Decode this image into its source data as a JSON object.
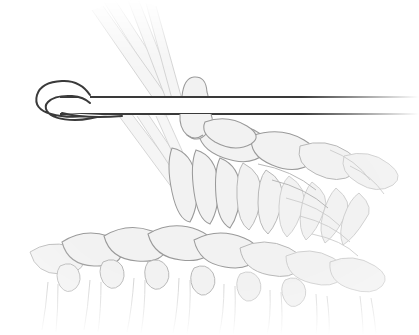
{
  "image": {
    "kind": "instructional-line-illustration",
    "subject": "crochet-stitch-diagram",
    "title": "Crochet hook drawing loop through fabric",
    "width_px": 419,
    "height_px": 335,
    "background_color": "#ffffff"
  },
  "palette": {
    "background": "#ffffff",
    "hook_outline": "#3a3a3a",
    "hook_fill": "#ffffff",
    "yarn_fill": "#f2f2f2",
    "yarn_outline": "#9a9a9a",
    "yarn_outline_soft": "#b4b4b4",
    "yarn_outline_faint": "#cccccc",
    "strand_fill": "#f4f4f4"
  },
  "objects": {
    "hook": {
      "name": "crochet-hook",
      "description": "Crochet hook, tip at left with throat notch, straight shaft extending to right edge",
      "tip_x": 30,
      "shaft_top_y": 96,
      "shaft_bottom_y": 114,
      "shaft_right_x": 419,
      "fades_at_right_edge": true
    },
    "working_loop": {
      "name": "working-loop-on-hook",
      "description": "Loop of yarn wrapped over the hook shaft",
      "center_x": 193,
      "center_y": 105
    },
    "yarn_strands": {
      "name": "yarn-strands",
      "description": "Strands of yarn rising to upper-left, passing behind the hook",
      "count": 4,
      "direction": "up-left",
      "fades_at_top": true
    },
    "fabric": {
      "name": "crocheted-fabric",
      "description": "Body of crocheted stitches below and right of the hook",
      "stitch_shape": "leaf",
      "row_count": 3,
      "fades_edges": [
        "left",
        "right",
        "bottom"
      ]
    }
  },
  "annotations": {
    "labels": [],
    "captions": [],
    "numbers": []
  }
}
